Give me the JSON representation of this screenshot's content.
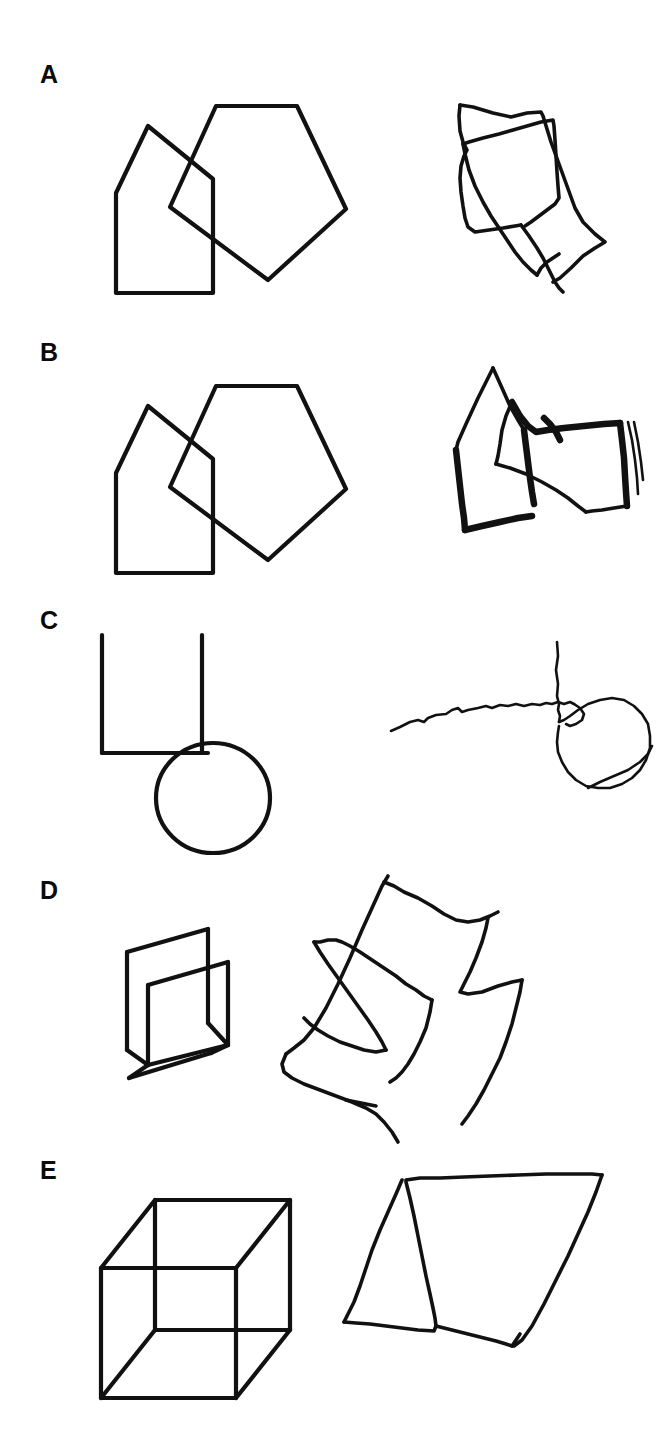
{
  "plate": {
    "title": "Figure copying plate",
    "description": "Five rows (A-E). Each row shows a model line drawing on the left and a freehand copy on the right.",
    "background_color": "#ffffff",
    "ink_color": "#111111",
    "columns": [
      "model",
      "copy"
    ]
  },
  "rows": [
    {
      "label": "A",
      "label_x": 40,
      "label_y": 62,
      "model": {
        "name": "two-overlapping-pentagons-model",
        "shapes": [
          {
            "name": "left-pentagon",
            "points": "28,113 60,46 125,99 125,213 28,213"
          },
          {
            "name": "right-pentagon",
            "points": "128,26 209,26 258,129 180,200 82,127"
          }
        ]
      },
      "copy": {
        "name": "two-overlapping-pentagons-copy",
        "paths": [
          "M5,19 L18,21 L38,27 L56,31 L72,27 L86,26 L88,30 L96,56 L104,78 L112,100 L120,122 L128,136 L140,148 L150,156 L140,162 L128,170 L116,182 L105,192 L98,196",
          "M5,19 L4,30 L5,45 L8,56 L12,64 L9,70 L6,80 L5,92 L6,106 L8,120 L10,132 L13,141 L20,146 L34,144 L48,142 L60,140 L66,139",
          "M8,58 L14,56 L28,52 L44,48 L58,44 L72,40 L86,36 L98,34 L99,40 L100,54 L101,70 L102,86 L103,100 L104,112 L100,118 L92,124 L84,130 L76,136 L70,140",
          "M8,58 L10,68 L14,84 L20,100 L28,116 L36,130 L44,142 L52,154 L60,166 L68,176 L76,184 L82,189",
          "M66,139 L74,150 L82,162 L88,172 L92,180 L96,188 L100,196 L104,202 L108,206",
          "M82,189 L86,182 L92,176 L98,172 L104,168"
        ]
      }
    },
    {
      "label": "B",
      "label_x": 40,
      "label_y": 340,
      "model": {
        "name": "two-overlapping-pentagons-model",
        "shapes": [
          {
            "name": "left-pentagon",
            "points": "28,113 60,46 125,99 125,213 28,213"
          },
          {
            "name": "right-pentagon",
            "points": "128,26 209,26 258,129 180,200 82,127"
          }
        ]
      },
      "copy": {
        "name": "two-overlapping-pentagons-copy-heavy",
        "paths": [
          "M41,10 L26,40 L14,66 L6,84 L4,92",
          "M41,10 L50,30 L58,48 L66,62 L72,72",
          "M4,92 L6,110 L8,128 L10,146 L12,160 L13,172",
          "M13,172 L30,168 L48,164 L66,160 L80,158",
          "M72,72 L74,88 L76,104 L78,120 L80,134 L82,146",
          "M60,44 L68,58 L76,68 L84,74 L96,72 L112,70 L132,68 L152,66 L168,65",
          "M60,44 L54,58 L50,72 L48,86 L46,98 L44,106",
          "M44,106 L58,110 L74,116 L90,124 L104,132 L116,140 L126,148 L134,154",
          "M168,65 L170,82 L172,100 L173,118 L174,134 L175,148",
          "M175,148 L162,150 L150,152 L140,153 L134,154",
          "M176,64 L180,82 L183,102 L185,120 L186,136",
          "M182,64 L186,84 L189,104 L191,122",
          "M92,60 L98,66 L104,74 L108,82"
        ]
      }
    },
    {
      "label": "C",
      "label_x": 40,
      "label_y": 608,
      "model": {
        "name": "circle-with-two-lines-model",
        "shapes": [
          {
            "name": "vertical-left-line",
            "points": "6,10 6,128"
          },
          {
            "name": "horizontal-line",
            "points": "6,128 112,128"
          },
          {
            "name": "vertical-right-line",
            "points": "106,10 106,128"
          },
          {
            "name": "circle",
            "cx": 117,
            "cy": 173,
            "rx": 57,
            "ry": 55
          }
        ]
      },
      "copy": {
        "name": "circle-with-line-copy",
        "paths": [
          "M3,89 L12,85 L22,80 L30,78 L36,80 L40,76 L48,73 L58,72 L64,68 L70,66 L74,70 L80,68 L90,66 L98,64 L104,66 L112,63 L120,64 L128,62 L136,64 L144,62 L152,63 L158,61 L164,62 L170,60 L176,62 L182,60 L186,62",
          "M169,0 L170,14 L168,28 L170,42 L169,54 L171,62 L170,68 L172,74 L171,80",
          "M171,80 L176,78 L182,74 L190,68 L200,62 L212,58 L224,56 L236,58 L246,64 L254,72 L260,82 L262,94 L262,106 L258,118 L252,128 L244,136 L234,142 L222,146 L210,146 L198,144 L188,138 L180,130 L174,120 L170,110 L169,100 L170,90 L171,84",
          "M186,62 L192,66 L196,72 L194,78 L188,82 L182,84 L178,82",
          "M200,146 L212,140 L226,134 L240,128 L252,120 L260,112 L264,104"
        ]
      }
    },
    {
      "label": "D",
      "label_x": 40,
      "label_y": 878,
      "model": {
        "name": "open-box-3d-model",
        "shapes": [
          {
            "name": "back-panel-top",
            "points": "12,47 93,24"
          },
          {
            "name": "back-panel-right",
            "points": "93,24 93,118"
          },
          {
            "name": "back-panel-left",
            "points": "12,47 12,145"
          },
          {
            "name": "inner-panel-top",
            "points": "33,80 113,57"
          },
          {
            "name": "inner-panel-left",
            "points": "33,80 33,160"
          },
          {
            "name": "inner-panel-right",
            "points": "113,57 113,140"
          },
          {
            "name": "bottom-front",
            "points": "33,160 14,173"
          },
          {
            "name": "bottom-edge",
            "points": "14,173 96,148"
          },
          {
            "name": "bottom-right",
            "points": "96,148 113,140"
          },
          {
            "name": "diagonal-right",
            "points": "93,118 113,140"
          },
          {
            "name": "base-left",
            "points": "12,145 33,160"
          },
          {
            "name": "base-run",
            "points": "12,145 12,145"
          }
        ]
      },
      "copy": {
        "name": "nested-quadrilaterals-copy",
        "paths": [
          "M116,4 L110,14 L100,36 L90,58 L78,86 L66,112 L54,136 L42,156 L32,168 L22,176 L14,182",
          "M112,10 L122,14 L132,20 L146,26 L160,34 L172,42 L184,48 L196,50 L208,48 L218,44 L226,40",
          "M216,46 L214,56 L210,70 L204,86 L198,100 L192,112 L188,120 L196,122 L210,120 L226,114 L240,110 L250,108",
          "M250,108 L248,120 L244,136 L240,152 L234,170 L228,186 L220,202 L212,218 L204,232 L196,244 L190,252",
          "M14,182 L10,192 L12,200 L20,206 L32,212 L48,218 L64,224 L80,230 L94,236 L104,242 L112,250 L120,260 L126,270",
          "M42,70 L48,70 L56,68 L64,68 L70,70 L78,74 L88,80 L100,88 L112,96 L124,104 L134,112 L144,118 L152,124 L160,128",
          "M42,70 L48,80 L56,92 L66,106 L76,120 L86,134 L96,148 L104,160 L110,170 L114,178",
          "M114,178 L104,180 L92,178 L80,174 L68,170 L56,164 L46,158 L38,152 L32,146",
          "M160,128 L158,140 L154,156 L148,170 L142,182 L136,192 L130,200 L124,206 L118,210",
          "M74,228 L84,230 L94,232 L104,234"
        ]
      }
    },
    {
      "label": "E",
      "label_x": 40,
      "label_y": 1158,
      "model": {
        "name": "necker-cube-model",
        "shapes": [
          {
            "name": "front-face",
            "points": "7,106 7,236 142,236 142,106 7,106"
          },
          {
            "name": "back-face",
            "points": "61,38 61,168 196,168 196,38 61,38"
          },
          {
            "name": "connector-top-left",
            "points": "7,106 61,38"
          },
          {
            "name": "connector-top-right",
            "points": "142,106 196,38"
          },
          {
            "name": "connector-bottom-left",
            "points": "7,236 61,168"
          },
          {
            "name": "connector-bottom-right",
            "points": "142,236 196,168"
          }
        ]
      },
      "copy": {
        "name": "parallelogram-copy",
        "paths": [
          "M66,12 L80,10 L100,10 L124,9 L150,8 L178,7 L206,6 L232,6 L252,6 L262,7",
          "M62,12 L56,26 L48,44 L40,62 L32,82 L26,100 L20,118 L14,134 L8,146 L4,154",
          "M66,14 L70,30 L74,48 L78,68 L82,88 L86,108 L90,126 L93,140 L95,150 L96,158",
          "M4,154 L16,155 L30,156 L46,158 L62,160 L78,162 L94,163 L96,158",
          "M96,158 L112,162 L128,166 L144,170 L156,173 L166,176 L172,178",
          "M262,7 L256,24 L248,44 L238,66 L228,88 L216,112 L204,136 L192,158 L182,172 L174,178",
          "M172,178 L176,172 L180,166"
        ]
      }
    }
  ]
}
